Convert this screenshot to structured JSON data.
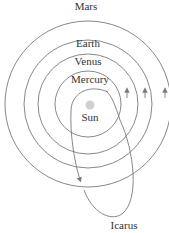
{
  "diagram": {
    "labels": {
      "mars": "Mars",
      "earth": "Earth",
      "venus": "Venus",
      "mercury": "Mercury",
      "sun": "Sun",
      "icarus": "Icarus"
    },
    "colors": {
      "orbit": "#7a7a7a",
      "sun": "#d0d0d0",
      "text": "#333333"
    }
  }
}
